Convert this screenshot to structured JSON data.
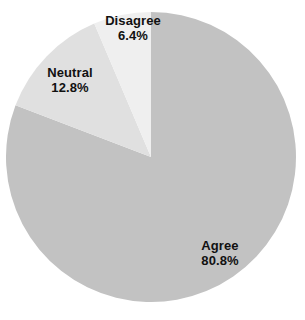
{
  "chart_data": {
    "type": "pie",
    "title": "",
    "categories": [
      "Agree",
      "Neutral",
      "Disagree"
    ],
    "values": [
      80.8,
      12.8,
      6.4
    ],
    "labels": [
      "80.8%",
      "12.8%",
      "6.4%"
    ],
    "units": "percent",
    "legend": "none",
    "grid": false,
    "start_angle_deg": 0,
    "direction": "clockwise",
    "colors": [
      "#c2c2c2",
      "#e0e0e0",
      "#efefef"
    ],
    "background_color": "#ffffff",
    "label_color": "#111111",
    "slices": [
      {
        "name": "Agree",
        "value": 80.8,
        "value_label": "80.8%",
        "color": "#c2c2c2",
        "start_deg": 0,
        "end_deg": 290.88
      },
      {
        "name": "Neutral",
        "value": 12.8,
        "value_label": "12.8%",
        "color": "#e0e0e0",
        "start_deg": 290.88,
        "end_deg": 336.96
      },
      {
        "name": "Disagree",
        "value": 6.4,
        "value_label": "6.4%",
        "color": "#efefef",
        "start_deg": 336.96,
        "end_deg": 360
      }
    ]
  },
  "labels": {
    "agree": {
      "name": "Agree",
      "value": "80.8%"
    },
    "neutral": {
      "name": "Neutral",
      "value": "12.8%"
    },
    "disagree": {
      "name": "Disagree",
      "value": "6.4%"
    }
  }
}
